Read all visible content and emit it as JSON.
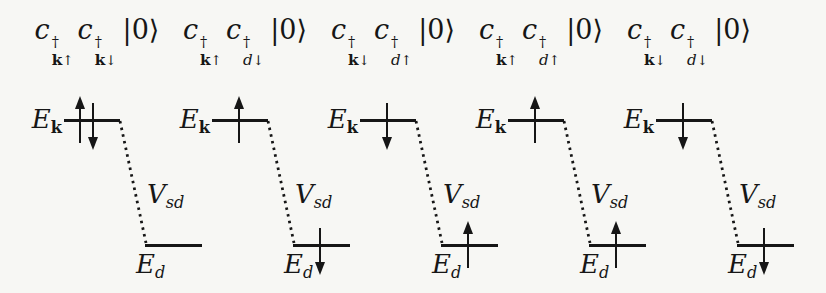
{
  "figure": {
    "ink_color": "#161616",
    "background_color": "#f7f7f4",
    "panels": [
      {
        "state": {
          "op1": {
            "base": "c",
            "dagger": "†",
            "sub_base": "k",
            "sub_arrow": "↑"
          },
          "op2": {
            "base": "c",
            "dagger": "†",
            "sub_base": "k",
            "sub_arrow": "↓"
          },
          "ket": "|0⟩"
        },
        "upper": {
          "label_base": "E",
          "label_sub": "k",
          "spins": [
            "up",
            "down"
          ]
        },
        "coupling": {
          "base": "V",
          "sub": "sd"
        },
        "lower": {
          "label_base": "E",
          "label_sub": "d",
          "spins": []
        }
      },
      {
        "state": {
          "op1": {
            "base": "c",
            "dagger": "†",
            "sub_base": "k",
            "sub_arrow": "↑"
          },
          "op2": {
            "base": "c",
            "dagger": "†",
            "sub_base": "d",
            "sub_arrow": "↓"
          },
          "ket": "|0⟩"
        },
        "upper": {
          "label_base": "E",
          "label_sub": "k",
          "spins": [
            "up"
          ]
        },
        "coupling": {
          "base": "V",
          "sub": "sd"
        },
        "lower": {
          "label_base": "E",
          "label_sub": "d",
          "spins": [
            "down"
          ]
        }
      },
      {
        "state": {
          "op1": {
            "base": "c",
            "dagger": "†",
            "sub_base": "k",
            "sub_arrow": "↓"
          },
          "op2": {
            "base": "c",
            "dagger": "†",
            "sub_base": "d",
            "sub_arrow": "↑"
          },
          "ket": "|0⟩"
        },
        "upper": {
          "label_base": "E",
          "label_sub": "k",
          "spins": [
            "down"
          ]
        },
        "coupling": {
          "base": "V",
          "sub": "sd"
        },
        "lower": {
          "label_base": "E",
          "label_sub": "d",
          "spins": [
            "up"
          ]
        }
      },
      {
        "state": {
          "op1": {
            "base": "c",
            "dagger": "†",
            "sub_base": "k",
            "sub_arrow": "↑"
          },
          "op2": {
            "base": "c",
            "dagger": "†",
            "sub_base": "d",
            "sub_arrow": "↑"
          },
          "ket": "|0⟩"
        },
        "upper": {
          "label_base": "E",
          "label_sub": "k",
          "spins": [
            "up"
          ]
        },
        "coupling": {
          "base": "V",
          "sub": "sd"
        },
        "lower": {
          "label_base": "E",
          "label_sub": "d",
          "spins": [
            "up"
          ]
        }
      },
      {
        "state": {
          "op1": {
            "base": "c",
            "dagger": "†",
            "sub_base": "k",
            "sub_arrow": "↓"
          },
          "op2": {
            "base": "c",
            "dagger": "†",
            "sub_base": "d",
            "sub_arrow": "↓"
          },
          "ket": "|0⟩"
        },
        "upper": {
          "label_base": "E",
          "label_sub": "k",
          "spins": [
            "down"
          ]
        },
        "coupling": {
          "base": "V",
          "sub": "sd"
        },
        "lower": {
          "label_base": "E",
          "label_sub": "d",
          "spins": [
            "down"
          ]
        }
      }
    ]
  }
}
